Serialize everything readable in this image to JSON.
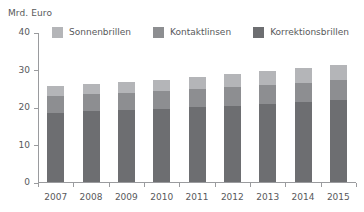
{
  "axis_unit": "Mrd. Euro",
  "legend": {
    "items": [
      {
        "label": "Sonnenbrillen",
        "color": "#b4b5b8",
        "key": "sonnenbrillen"
      },
      {
        "label": "Kontaktlinsen",
        "color": "#8d8e91",
        "key": "kontaktlinsen"
      },
      {
        "label": "Korrektionsbrillen",
        "color": "#6d6e71",
        "key": "korrektionsbrillen"
      }
    ]
  },
  "chart_data": {
    "type": "bar",
    "stacked": true,
    "title": "",
    "subtitle": "",
    "xlabel": "",
    "ylabel": "Mrd. Euro",
    "ylim": [
      0,
      40
    ],
    "yticks": [
      0,
      10,
      20,
      30,
      40
    ],
    "ytick_labels": [
      "0",
      "10",
      "20",
      "30",
      "40"
    ],
    "grid": false,
    "legend_position": "top",
    "categories": [
      "2007",
      "2008",
      "2009",
      "2010",
      "2011",
      "2012",
      "2013",
      "2014",
      "2015"
    ],
    "series": [
      {
        "name": "Korrektionsbrillen",
        "color": "#6d6e71",
        "values": [
          18.5,
          18.9,
          19.2,
          19.6,
          20.0,
          20.4,
          20.8,
          21.3,
          21.8
        ]
      },
      {
        "name": "Kontaktlinsen",
        "color": "#8d8e91",
        "values": [
          4.4,
          4.5,
          4.6,
          4.7,
          4.8,
          4.9,
          5.1,
          5.2,
          5.4
        ]
      },
      {
        "name": "Sonnenbrillen",
        "color": "#b4b5b8",
        "values": [
          2.6,
          2.7,
          2.8,
          3.0,
          3.3,
          3.5,
          3.7,
          3.9,
          4.1
        ]
      }
    ],
    "totals": [
      25.5,
      26.1,
      26.6,
      27.3,
      28.1,
      28.8,
      29.6,
      30.4,
      31.3
    ]
  }
}
